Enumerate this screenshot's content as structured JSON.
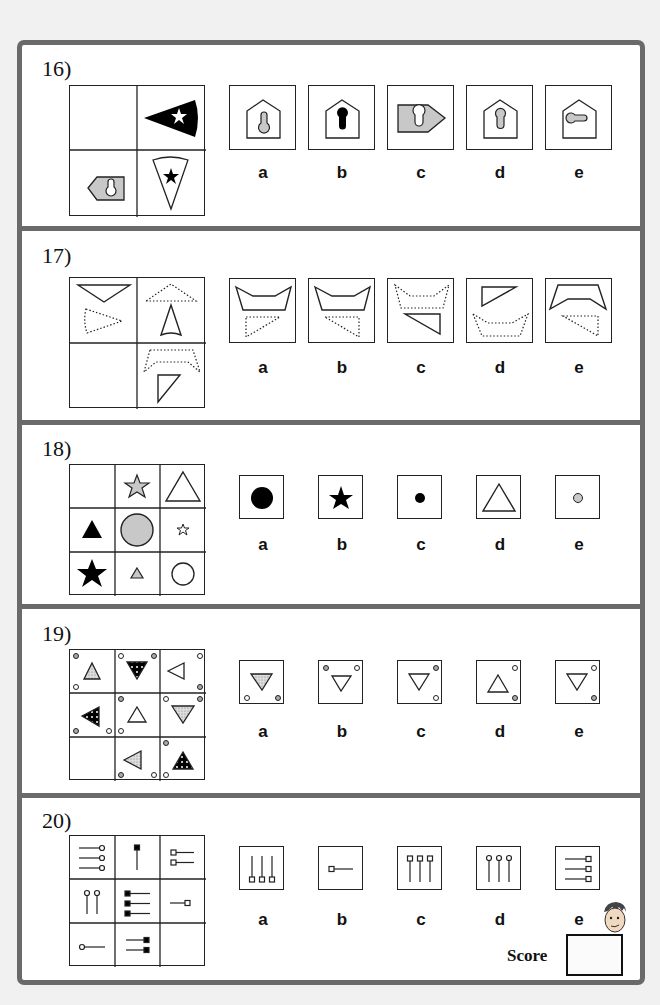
{
  "page": {
    "background": "#f1f1f1",
    "frame_color": "#6a6a6a",
    "fill_gray": "#c8c8c8",
    "ink": "#111111"
  },
  "questions": [
    {
      "number": "16)",
      "grid": {
        "rows": 2,
        "cols": 2,
        "cells": [
          "empty",
          "black-sector-white-star-pointing-left",
          "gray-pentagon-tag-white-keyhole-pointing-left",
          "white-sector-black-star-pointing-down"
        ]
      },
      "options": [
        {
          "label": "a",
          "figure": "house-pentagon-gray-keyhole-round-bottom"
        },
        {
          "label": "b",
          "figure": "house-pentagon-black-keyhole-round-top"
        },
        {
          "label": "c",
          "figure": "gray-pentagon-tag-white-keyhole-pointing-right"
        },
        {
          "label": "d",
          "figure": "house-pentagon-gray-keyhole-round-top"
        },
        {
          "label": "e",
          "figure": "house-pentagon-gray-keyhole-sideways"
        }
      ]
    },
    {
      "number": "17)",
      "grid": {
        "rows": 2,
        "cols": 2,
        "cells": [
          "solid-inverted-triangle-plus-dotted-sector",
          "dotted-triangle-plus-solid-sector",
          "empty",
          "dotted-trapezoid-shape-plus-solid-right-triangle"
        ]
      },
      "options": [
        {
          "label": "a",
          "figure": "solid-bowl-hexagon-plus-dotted-triangle-left"
        },
        {
          "label": "b",
          "figure": "solid-bowl-hexagon-plus-dotted-triangle-right"
        },
        {
          "label": "c",
          "figure": "dotted-bowl-hexagon-plus-solid-triangle"
        },
        {
          "label": "d",
          "figure": "solid-triangle-plus-dotted-bowl-hexagon"
        },
        {
          "label": "e",
          "figure": "solid-inverted-bowl-plus-dotted-triangle"
        }
      ]
    },
    {
      "number": "18)",
      "grid": {
        "rows": 3,
        "cols": 3,
        "cells": [
          "empty",
          "gray-star-medium",
          "white-triangle-large",
          "black-triangle-medium",
          "gray-circle-large",
          "white-star-small",
          "black-star-large",
          "gray-triangle-small",
          "white-circle-medium"
        ]
      },
      "options": [
        {
          "label": "a",
          "figure": "black-circle-large"
        },
        {
          "label": "b",
          "figure": "black-star-medium"
        },
        {
          "label": "c",
          "figure": "black-circle-small"
        },
        {
          "label": "d",
          "figure": "white-triangle-large"
        },
        {
          "label": "e",
          "figure": "gray-circle-small"
        }
      ]
    },
    {
      "number": "19)",
      "grid": {
        "rows": 3,
        "cols": 3,
        "cells": [
          "dotted-triangle-up-with-corner-dots",
          "black-pattern-triangle-down",
          "white-triangle-left",
          "black-pattern-triangle-left",
          "white-triangle-up",
          "dotted-triangle-down",
          "empty",
          "dotted-triangle-left",
          "black-pattern-triangle-up"
        ]
      },
      "options": [
        {
          "label": "a",
          "figure": "dotted-triangle-down-dots-bottom"
        },
        {
          "label": "b",
          "figure": "white-triangle-down-dots-top"
        },
        {
          "label": "c",
          "figure": "white-triangle-down-dots-right"
        },
        {
          "label": "d",
          "figure": "white-triangle-up-dots-right"
        },
        {
          "label": "e",
          "figure": "white-triangle-down-dots-right-alt"
        }
      ]
    },
    {
      "number": "20)",
      "grid": {
        "rows": 3,
        "cols": 3,
        "cells": [
          "three-lines-circle-right",
          "one-line-black-square-top",
          "two-lines-square-left",
          "two-lines-circle-top",
          "three-lines-black-square-left",
          "one-line-square-right",
          "one-line-circle-left",
          "two-lines-black-square-right",
          "empty"
        ]
      },
      "options": [
        {
          "label": "a",
          "figure": "three-vertical-lines-square-bottom"
        },
        {
          "label": "b",
          "figure": "one-line-square-left"
        },
        {
          "label": "c",
          "figure": "three-vertical-lines-square-top"
        },
        {
          "label": "d",
          "figure": "three-vertical-lines-circle-top"
        },
        {
          "label": "e",
          "figure": "three-horizontal-lines-square-right"
        }
      ]
    }
  ],
  "score": {
    "label": "Score",
    "value": ""
  }
}
